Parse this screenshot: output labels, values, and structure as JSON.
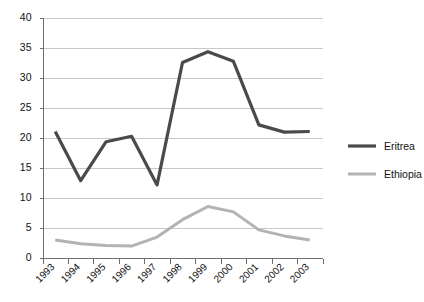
{
  "chart_data": {
    "type": "line",
    "title": "",
    "subtitle": "",
    "xlabel": "",
    "ylabel": "",
    "categories": [
      "1993",
      "1994",
      "1995",
      "1996",
      "1997",
      "1998",
      "1999",
      "2000",
      "2001",
      "2002",
      "2003"
    ],
    "series": [
      {
        "name": "Eritrea",
        "color": "#4a4a4a",
        "values": [
          21.0,
          12.8,
          19.3,
          20.2,
          12.1,
          32.5,
          34.3,
          32.7,
          22.1,
          20.9,
          21.0
        ]
      },
      {
        "name": "Ethiopia",
        "color": "#b3b3b3",
        "values": [
          2.9,
          2.3,
          2.0,
          1.9,
          3.4,
          6.3,
          8.5,
          7.6,
          4.6,
          3.6,
          2.9
        ]
      }
    ],
    "ylim": [
      0,
      40
    ],
    "ytick_values": [
      0,
      5,
      10,
      15,
      20,
      25,
      30,
      35,
      40
    ],
    "ytick_labels": [
      "0",
      "5",
      "10",
      "15",
      "20",
      "25",
      "30",
      "35",
      "40"
    ],
    "grid": true,
    "grid_axis": "y",
    "legend_position": "right",
    "background_color": "#ffffff",
    "gridline_color": "#c8c8c8",
    "axis_color": "#6f6f6f"
  },
  "legend": {
    "entries": [
      {
        "label": "Eritrea",
        "color": "#4a4a4a",
        "line_width": 3.2
      },
      {
        "label": "Ethiopia",
        "color": "#b3b3b3",
        "line_width": 3.0
      }
    ]
  }
}
